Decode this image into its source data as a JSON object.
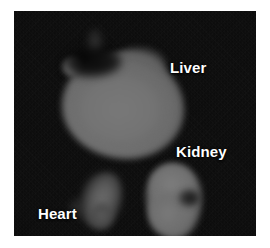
{
  "image": {
    "kind": "ex-vivo-organ-fluorescence-image",
    "modality": "fluorescence",
    "colormap": "grayscale",
    "background_color": "#080808",
    "panel_color": "#080808",
    "canvas_color": "#ffffff",
    "signal_color": "#747474",
    "label_color": "#ffffff"
  },
  "annotations": [
    {
      "id": "liver",
      "label": "Liver",
      "organ": "liver",
      "position": {
        "x": 170,
        "y": 60
      },
      "signal": "high",
      "intensity_gray": 116
    },
    {
      "id": "kidney",
      "label": "Kidney",
      "organ": "kidney",
      "position": {
        "x": 176,
        "y": 144
      },
      "signal": "high",
      "intensity_gray": 113
    },
    {
      "id": "heart",
      "label": "Heart",
      "organ": "heart",
      "position": {
        "x": 38,
        "y": 206
      },
      "signal": "low",
      "intensity_gray": 80
    }
  ],
  "regions": [
    {
      "id": "liver-mass",
      "organ": "liver",
      "center": {
        "x": 109,
        "y": 95
      },
      "width": 122,
      "height": 106
    },
    {
      "id": "kidney-mass",
      "organ": "kidney",
      "center": {
        "x": 160,
        "y": 190
      },
      "width": 56,
      "height": 76
    },
    {
      "id": "heart-mass",
      "organ": "heart",
      "center": {
        "x": 87,
        "y": 189
      },
      "width": 42,
      "height": 58
    }
  ]
}
